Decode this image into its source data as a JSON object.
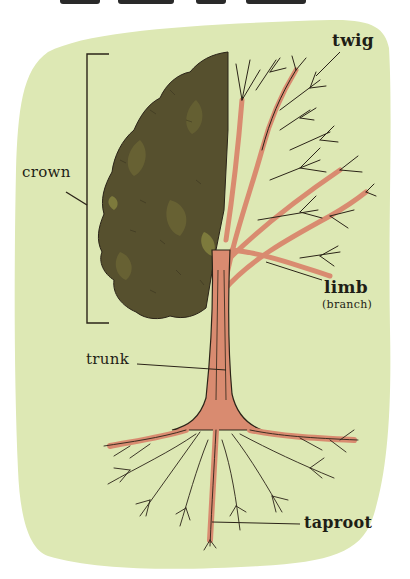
{
  "diagram": {
    "colors": {
      "paper_background": "#dde8b4",
      "page_background": "#ffffff",
      "foliage": "#56502e",
      "foliage_highlight": "#7d7a3c",
      "trunk": "#d98b70",
      "outline": "#2b2418",
      "label_text": "#1e1e16"
    },
    "labels": {
      "twig": "twig",
      "crown": "crown",
      "limb": "limb",
      "branch_note": "(branch)",
      "trunk": "trunk",
      "taproot": "taproot"
    }
  }
}
